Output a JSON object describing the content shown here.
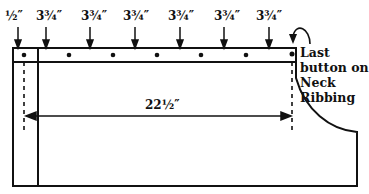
{
  "diagram": {
    "spacing_labels": [
      {
        "text": "½″",
        "x": 5
      },
      {
        "text": "3¾″",
        "x": 36
      },
      {
        "text": "3¾″",
        "x": 81
      },
      {
        "text": "3¾″",
        "x": 123
      },
      {
        "text": "3¾″",
        "x": 168
      },
      {
        "text": "3¾″",
        "x": 214
      },
      {
        "text": "3¾″",
        "x": 256
      }
    ],
    "width_label": "22½″",
    "note_lines": [
      "Last",
      "button on",
      "Neck",
      "Ribbing"
    ],
    "button_count": 7,
    "line_color": "#111111"
  }
}
